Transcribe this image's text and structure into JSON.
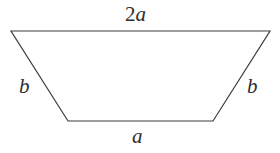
{
  "figure": {
    "name": "isosceles-trapezoid",
    "background_color": "#ffffff",
    "stroke_color": "#3c3c3c",
    "stroke_width": 1.2,
    "text_color": "#2e2e2e",
    "canvas": {
      "width": 280,
      "height": 153
    },
    "vertices": {
      "top_left": {
        "x": 11,
        "y": 31
      },
      "top_right": {
        "x": 270,
        "y": 31
      },
      "bottom_right": {
        "x": 213,
        "y": 121
      },
      "bottom_left": {
        "x": 68,
        "y": 121
      }
    },
    "polygon_points": "11,31 270,31 213,121 68,121",
    "labels": {
      "top": {
        "coefficient": "2",
        "variable": "a",
        "full": "2a"
      },
      "bottom": {
        "coefficient": "",
        "variable": "a",
        "full": "a"
      },
      "left_leg": {
        "coefficient": "",
        "variable": "b",
        "full": "b"
      },
      "right_leg": {
        "coefficient": "",
        "variable": "b",
        "full": "b"
      }
    }
  },
  "chart_data": {
    "type": "diagram",
    "shape": "isosceles trapezoid",
    "title": "",
    "side_labels": [
      "2a",
      "b",
      "a",
      "b"
    ],
    "sides": [
      {
        "name": "top",
        "label": "2a",
        "from": "top_left",
        "to": "top_right",
        "pixel_length": 259
      },
      {
        "name": "right-leg",
        "label": "b",
        "from": "top_right",
        "to": "bottom_right",
        "pixel_length": 172
      },
      {
        "name": "bottom",
        "label": "a",
        "from": "bottom_right",
        "to": "bottom_left",
        "pixel_length": 145
      },
      {
        "name": "left-leg",
        "label": "b",
        "from": "bottom_left",
        "to": "top_left",
        "pixel_length": 172
      }
    ],
    "grid": false,
    "legend": false
  }
}
